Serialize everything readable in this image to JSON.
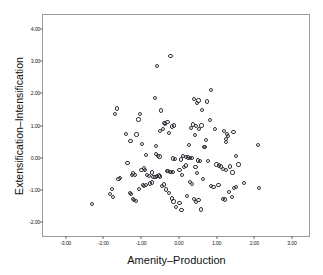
{
  "chart_data": {
    "type": "scatter",
    "title": "",
    "xlabel": "Amenity–Production",
    "ylabel": "Extensification–Intensification",
    "xlim": [
      -3.6,
      3.45
    ],
    "ylim": [
      -2.45,
      4.45
    ],
    "xticks": [
      "-3.00",
      "-2.00",
      "-1.00",
      "0.00",
      "1.00",
      "2.00",
      "3.00"
    ],
    "xtick_values": [
      -3,
      -2,
      -1,
      0,
      1,
      2,
      3
    ],
    "yticks": [
      "4.00",
      "3.00",
      "2.00",
      "1.00",
      "0.00",
      "-1.00",
      "-2.00"
    ],
    "ytick_values": [
      4,
      3,
      2,
      1,
      0,
      -1,
      -2
    ],
    "grid": false,
    "legend": false,
    "marker": "open-circle",
    "marker_color": "#30343a",
    "frame_color": "#9a9a9a",
    "background": "#ffffff",
    "n_points": 141,
    "points": [
      [
        -0.22,
        3.17
      ],
      [
        -0.57,
        2.85
      ],
      [
        0.86,
        2.1
      ],
      [
        -0.63,
        1.87
      ],
      [
        0.4,
        1.82
      ],
      [
        0.52,
        1.78
      ],
      [
        0.74,
        1.75
      ],
      [
        0.48,
        1.69
      ],
      [
        -1.64,
        1.53
      ],
      [
        -1.7,
        1.35
      ],
      [
        0.62,
        1.49
      ],
      [
        -0.47,
        1.47
      ],
      [
        -1.02,
        1.36
      ],
      [
        -1.07,
        1.19
      ],
      [
        0.82,
        1.17
      ],
      [
        -0.3,
        1.12
      ],
      [
        -0.38,
        1.07
      ],
      [
        -0.36,
        1.05
      ],
      [
        0.37,
        1.03
      ],
      [
        0.46,
        0.98
      ],
      [
        -0.12,
        1.0
      ],
      [
        -0.19,
        0.97
      ],
      [
        0.33,
        0.92
      ],
      [
        0.54,
        0.9
      ],
      [
        0.6,
        1.0
      ],
      [
        0.95,
        0.88
      ],
      [
        -0.41,
        0.88
      ],
      [
        -0.5,
        0.82
      ],
      [
        1.2,
        0.82
      ],
      [
        1.45,
        0.8
      ],
      [
        -1.4,
        0.74
      ],
      [
        -1.12,
        0.72
      ],
      [
        -0.26,
        0.76
      ],
      [
        1.27,
        0.74
      ],
      [
        1.3,
        0.66
      ],
      [
        0.43,
        0.7
      ],
      [
        0.73,
        0.55
      ],
      [
        1.24,
        0.57
      ],
      [
        1.26,
        0.48
      ],
      [
        -1.28,
        0.52
      ],
      [
        -0.97,
        0.43
      ],
      [
        -0.6,
        0.35
      ],
      [
        0.28,
        0.38
      ],
      [
        0.66,
        0.34
      ],
      [
        0.7,
        0.32
      ],
      [
        2.1,
        0.39
      ],
      [
        -0.88,
        0.09
      ],
      [
        -0.6,
        0.1
      ],
      [
        -0.56,
        0.05
      ],
      [
        -0.51,
        0.03
      ],
      [
        0.19,
        0.02
      ],
      [
        0.24,
        0.0
      ],
      [
        0.3,
        -0.01
      ],
      [
        0.34,
        -0.02
      ],
      [
        0.1,
        0.04
      ],
      [
        0.05,
        -0.06
      ],
      [
        -0.11,
        -0.05
      ],
      [
        -0.15,
        -0.03
      ],
      [
        0.5,
        -0.09
      ],
      [
        0.56,
        -0.12
      ],
      [
        1.52,
        0.06
      ],
      [
        -1.36,
        -0.18
      ],
      [
        -1.22,
        -0.5
      ],
      [
        -1.17,
        -0.55
      ],
      [
        -1.25,
        -0.54
      ],
      [
        -0.99,
        -0.4
      ],
      [
        -0.93,
        -0.34
      ],
      [
        -0.9,
        -0.38
      ],
      [
        -0.84,
        -0.55
      ],
      [
        -0.8,
        -0.58
      ],
      [
        -0.71,
        -0.47
      ],
      [
        -0.67,
        -0.6
      ],
      [
        -0.62,
        -0.62
      ],
      [
        -0.58,
        -0.57
      ],
      [
        -0.53,
        -0.56
      ],
      [
        -0.49,
        -0.59
      ],
      [
        -0.32,
        -0.43
      ],
      [
        -0.28,
        -0.42
      ],
      [
        -0.24,
        -0.44
      ],
      [
        -0.2,
        -0.46
      ],
      [
        -0.16,
        -0.45
      ],
      [
        0.02,
        -0.4
      ],
      [
        0.08,
        -0.55
      ],
      [
        0.14,
        -0.3
      ],
      [
        0.18,
        -0.25
      ],
      [
        0.44,
        -0.3
      ],
      [
        0.49,
        -0.48
      ],
      [
        0.78,
        -0.1
      ],
      [
        1.0,
        -0.22
      ],
      [
        1.06,
        -0.25
      ],
      [
        1.11,
        -0.28
      ],
      [
        1.18,
        -0.35
      ],
      [
        1.24,
        -0.38
      ],
      [
        1.36,
        -0.28
      ],
      [
        1.42,
        -0.47
      ],
      [
        1.58,
        -0.22
      ],
      [
        -1.55,
        -0.63
      ],
      [
        -1.6,
        -0.66
      ],
      [
        -1.78,
        -0.98
      ],
      [
        -1.82,
        -1.15
      ],
      [
        -1.74,
        -1.22
      ],
      [
        -1.3,
        -1.1
      ],
      [
        -1.26,
        -1.13
      ],
      [
        -1.22,
        -1.3
      ],
      [
        -1.19,
        -1.33
      ],
      [
        -1.14,
        -1.35
      ],
      [
        -1.05,
        -0.98
      ],
      [
        -0.96,
        -0.86
      ],
      [
        -0.92,
        -0.88
      ],
      [
        -0.88,
        -0.87
      ],
      [
        -0.76,
        -0.81
      ],
      [
        -0.72,
        -0.78
      ],
      [
        -0.44,
        -0.88
      ],
      [
        -0.4,
        -0.84
      ],
      [
        -0.34,
        -1.0
      ],
      [
        -0.25,
        -1.12
      ],
      [
        -0.18,
        -1.28
      ],
      [
        -0.14,
        -1.37
      ],
      [
        -0.08,
        -1.55
      ],
      [
        0.02,
        -1.42
      ],
      [
        0.07,
        -1.63
      ],
      [
        0.22,
        -1.2
      ],
      [
        0.3,
        -0.77
      ],
      [
        0.35,
        -0.82
      ],
      [
        0.41,
        -1.3
      ],
      [
        0.46,
        -1.4
      ],
      [
        0.52,
        -1.32
      ],
      [
        0.58,
        -1.62
      ],
      [
        0.64,
        -0.66
      ],
      [
        0.86,
        -0.88
      ],
      [
        0.92,
        -0.92
      ],
      [
        1.05,
        -0.87
      ],
      [
        1.16,
        -1.3
      ],
      [
        1.22,
        -1.31
      ],
      [
        1.33,
        -1.08
      ],
      [
        1.4,
        -1.22
      ],
      [
        1.47,
        -0.94
      ],
      [
        1.52,
        -0.92
      ],
      [
        1.73,
        -0.8
      ],
      [
        2.12,
        -0.96
      ],
      [
        -2.3,
        -1.45
      ]
    ]
  }
}
